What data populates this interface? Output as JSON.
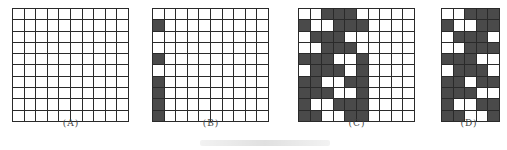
{
  "figure": {
    "panels": [
      {
        "label": "(A)",
        "rows": 10,
        "cols": 10,
        "cells": [
          [
            0,
            0,
            0,
            0,
            0,
            0,
            0,
            0,
            0,
            0
          ],
          [
            0,
            0,
            0,
            0,
            0,
            0,
            0,
            0,
            0,
            0
          ],
          [
            0,
            0,
            0,
            0,
            0,
            0,
            0,
            0,
            0,
            0
          ],
          [
            0,
            0,
            0,
            0,
            0,
            0,
            0,
            0,
            0,
            0
          ],
          [
            0,
            0,
            0,
            0,
            0,
            0,
            0,
            0,
            0,
            0
          ],
          [
            0,
            0,
            0,
            0,
            0,
            0,
            0,
            0,
            0,
            0
          ],
          [
            0,
            0,
            0,
            0,
            0,
            0,
            0,
            0,
            0,
            0
          ],
          [
            0,
            0,
            0,
            0,
            0,
            0,
            0,
            0,
            0,
            0
          ],
          [
            0,
            0,
            0,
            0,
            0,
            0,
            0,
            0,
            0,
            0
          ],
          [
            0,
            0,
            0,
            0,
            0,
            0,
            0,
            0,
            0,
            0
          ]
        ]
      },
      {
        "label": "(B)",
        "rows": 10,
        "cols": 10,
        "cells": [
          [
            0,
            0,
            0,
            0,
            0,
            0,
            0,
            0,
            0,
            0
          ],
          [
            1,
            0,
            0,
            0,
            0,
            0,
            0,
            0,
            0,
            0
          ],
          [
            0,
            0,
            0,
            0,
            0,
            0,
            0,
            0,
            0,
            0
          ],
          [
            0,
            0,
            0,
            0,
            0,
            0,
            0,
            0,
            0,
            0
          ],
          [
            1,
            0,
            0,
            0,
            0,
            0,
            0,
            0,
            0,
            0
          ],
          [
            0,
            0,
            0,
            0,
            0,
            0,
            0,
            0,
            0,
            0
          ],
          [
            1,
            0,
            0,
            0,
            0,
            0,
            0,
            0,
            0,
            0
          ],
          [
            1,
            0,
            0,
            0,
            0,
            0,
            0,
            0,
            0,
            0
          ],
          [
            1,
            0,
            0,
            0,
            0,
            0,
            0,
            0,
            0,
            0
          ],
          [
            1,
            0,
            0,
            0,
            0,
            0,
            0,
            0,
            0,
            0
          ]
        ]
      },
      {
        "label": "(C)",
        "rows": 10,
        "cols": 10,
        "cells": [
          [
            0,
            0,
            1,
            1,
            1,
            0,
            0,
            0,
            0,
            0
          ],
          [
            1,
            0,
            0,
            1,
            1,
            1,
            0,
            0,
            0,
            0
          ],
          [
            0,
            1,
            1,
            1,
            0,
            0,
            0,
            0,
            0,
            0
          ],
          [
            0,
            0,
            1,
            1,
            1,
            0,
            0,
            0,
            0,
            0
          ],
          [
            1,
            1,
            1,
            0,
            0,
            1,
            0,
            0,
            0,
            0
          ],
          [
            0,
            1,
            1,
            1,
            0,
            1,
            0,
            0,
            0,
            0
          ],
          [
            1,
            1,
            0,
            0,
            1,
            1,
            0,
            0,
            0,
            0
          ],
          [
            1,
            1,
            1,
            0,
            0,
            1,
            0,
            0,
            0,
            0
          ],
          [
            1,
            0,
            0,
            1,
            1,
            1,
            0,
            0,
            0,
            0
          ],
          [
            1,
            1,
            0,
            0,
            1,
            1,
            0,
            0,
            0,
            0
          ]
        ]
      },
      {
        "label": "(D)",
        "rows": 10,
        "cols": 5,
        "cells": [
          [
            0,
            0,
            1,
            1,
            1
          ],
          [
            1,
            0,
            0,
            1,
            1
          ],
          [
            0,
            1,
            1,
            1,
            0
          ],
          [
            0,
            0,
            1,
            1,
            1
          ],
          [
            1,
            1,
            1,
            0,
            0
          ],
          [
            0,
            1,
            1,
            1,
            0
          ],
          [
            1,
            1,
            0,
            1,
            1
          ],
          [
            1,
            1,
            1,
            0,
            0
          ],
          [
            1,
            0,
            0,
            1,
            1
          ],
          [
            1,
            1,
            0,
            0,
            1
          ]
        ]
      }
    ],
    "colors": {
      "dark_cell": "#4a4a4a",
      "light_cell": "#ffffff",
      "grid_line": "#2a2a2a"
    }
  }
}
